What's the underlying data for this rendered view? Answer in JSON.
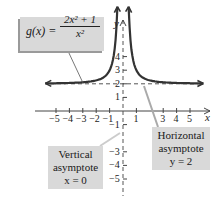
{
  "chart_data": {
    "type": "line",
    "title": "",
    "function_label": "g(x) = (2x^2 + 1) / x^2",
    "function": {
      "name": "g(x)",
      "numerator": "2x² + 1",
      "denominator": "x²"
    },
    "xlabel": "x",
    "ylabel": "y",
    "xlim": [
      -6,
      6
    ],
    "ylim": [
      -5.5,
      6.5
    ],
    "x_ticks": [
      -5,
      -4,
      -3,
      -2,
      -1,
      1,
      3,
      4,
      5
    ],
    "x_tick_labels": [
      "−5",
      "−4",
      "−3",
      "−2",
      "−1",
      "1",
      "3",
      "4",
      "5"
    ],
    "y_ticks": [
      -5,
      -4,
      -3,
      -1,
      1,
      2,
      3,
      4
    ],
    "y_tick_labels": [
      "−5",
      "−4",
      "−3",
      "−1",
      "1",
      "2",
      "3",
      "4"
    ],
    "grid": false,
    "series": [
      {
        "name": "g(x)",
        "x": [
          -6,
          -5,
          -4,
          -3,
          -2,
          -1,
          -0.8,
          -0.6,
          -0.5,
          -0.45,
          0.45,
          0.5,
          0.6,
          0.8,
          1,
          2,
          3,
          4,
          5,
          6
        ],
        "y": [
          2.03,
          2.04,
          2.06,
          2.11,
          2.25,
          3,
          3.56,
          4.78,
          6,
          6.94,
          6.94,
          6,
          4.78,
          3.56,
          3,
          2.25,
          2.11,
          2.06,
          2.04,
          2.03
        ]
      }
    ],
    "asymptotes": [
      {
        "type": "vertical",
        "equation": "x = 0",
        "style": "dashed"
      },
      {
        "type": "horizontal",
        "equation": "y = 2",
        "style": "dashed"
      }
    ],
    "annotations": [
      {
        "text": "Vertical asymptote x = 0"
      },
      {
        "text": "Horizontal asymptote y = 2"
      }
    ]
  },
  "labels": {
    "formula_lhs": "g(x) =",
    "formula_num": "2x² + 1",
    "formula_den": "x²",
    "vertical_line1": "Vertical",
    "vertical_line2": "asymptote",
    "vertical_line3": "x = 0",
    "horizontal_line1": "Horizontal",
    "horizontal_line2": "asymptote",
    "horizontal_line3": "y = 2",
    "x_axis": "x",
    "y_axis": "y"
  },
  "colors": {
    "curve": "#333333",
    "axis": "#444444",
    "box": "#d9d9d9",
    "dash": "#555555"
  }
}
